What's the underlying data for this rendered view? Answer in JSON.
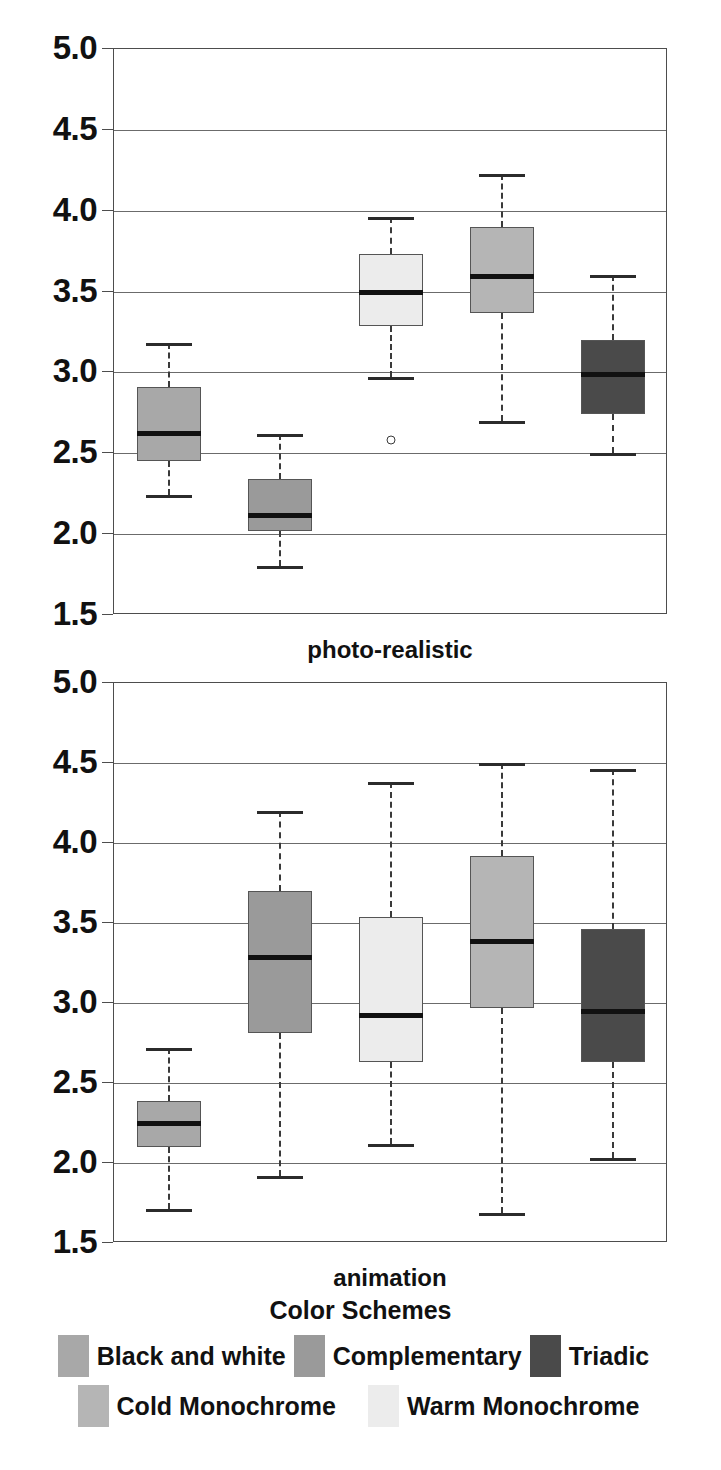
{
  "figure": {
    "title_clipped": "",
    "legend_title": "Color Schemes"
  },
  "colors": {
    "black_and_white": "#a8a8a8",
    "complementary": "#9a9a9a",
    "triadic": "#4a4a4a",
    "cold_monochrome": "#b5b5b5",
    "warm_monochrome": "#ececec",
    "axis": "#4d4d4d",
    "gridline": "#6b6b6b",
    "median": "#111111"
  },
  "axis": {
    "ticks": [
      "5.0",
      "4.5",
      "4.0",
      "3.5",
      "3.0",
      "2.5",
      "2.0",
      "1.5"
    ],
    "min": 1.5,
    "max": 5.0,
    "step": 0.5
  },
  "panels": [
    {
      "id": "photo",
      "xlabel": "photo-realistic"
    },
    {
      "id": "anim",
      "xlabel": "animation"
    }
  ],
  "legend": {
    "rows": [
      [
        {
          "label": "Black and white",
          "color_key": "black_and_white"
        },
        {
          "label": "Complementary",
          "color_key": "complementary"
        },
        {
          "label": "Triadic",
          "color_key": "triadic"
        }
      ],
      [
        {
          "label": "Cold Monochrome",
          "color_key": "cold_monochrome"
        },
        {
          "label": "Warm Monochrome",
          "color_key": "warm_monochrome"
        }
      ]
    ]
  },
  "chart_data": {
    "type": "box",
    "title": "",
    "ylabel": "",
    "xlabel": "",
    "ylim": [
      1.5,
      5.0
    ],
    "ytick_labels": [
      "1.5",
      "2.0",
      "2.5",
      "3.0",
      "3.5",
      "4.0",
      "4.5",
      "5.0"
    ],
    "grid": true,
    "legend_position": "bottom",
    "legend_title": "Color Schemes",
    "groups": [
      "photo-realistic",
      "animation"
    ],
    "categories": [
      "Black and white",
      "Complementary",
      "Warm Monochrome",
      "Cold Monochrome",
      "Triadic"
    ],
    "panels": [
      {
        "name": "photo-realistic",
        "boxes": [
          {
            "category": "Black and white",
            "color_key": "black_and_white",
            "whisker_low": 2.24,
            "q1": 2.45,
            "median": 2.64,
            "q3": 2.91,
            "whisker_high": 3.18,
            "outliers": []
          },
          {
            "category": "Complementary",
            "color_key": "complementary",
            "whisker_low": 1.8,
            "q1": 2.02,
            "median": 2.13,
            "q3": 2.34,
            "whisker_high": 2.62,
            "outliers": []
          },
          {
            "category": "Warm Monochrome",
            "color_key": "warm_monochrome",
            "whisker_low": 2.97,
            "q1": 3.29,
            "median": 3.51,
            "q3": 3.73,
            "whisker_high": 3.96,
            "outliers": [
              2.58
            ]
          },
          {
            "category": "Cold Monochrome",
            "color_key": "cold_monochrome",
            "whisker_low": 2.7,
            "q1": 3.37,
            "median": 3.61,
            "q3": 3.9,
            "whisker_high": 4.23,
            "outliers": []
          },
          {
            "category": "Triadic",
            "color_key": "triadic",
            "whisker_low": 2.5,
            "q1": 2.74,
            "median": 3.0,
            "q3": 3.2,
            "whisker_high": 3.6,
            "outliers": []
          }
        ]
      },
      {
        "name": "animation",
        "boxes": [
          {
            "category": "Black and white",
            "color_key": "black_and_white",
            "whisker_low": 1.71,
            "q1": 2.1,
            "median": 2.26,
            "q3": 2.39,
            "whisker_high": 2.72,
            "outliers": []
          },
          {
            "category": "Complementary",
            "color_key": "complementary",
            "whisker_low": 1.92,
            "q1": 2.81,
            "median": 3.3,
            "q3": 3.7,
            "whisker_high": 4.2,
            "outliers": []
          },
          {
            "category": "Warm Monochrome",
            "color_key": "warm_monochrome",
            "whisker_low": 2.12,
            "q1": 2.63,
            "median": 2.94,
            "q3": 3.54,
            "whisker_high": 4.38,
            "outliers": []
          },
          {
            "category": "Cold Monochrome",
            "color_key": "cold_monochrome",
            "whisker_low": 1.69,
            "q1": 2.97,
            "median": 3.4,
            "q3": 3.92,
            "whisker_high": 4.5,
            "outliers": []
          },
          {
            "category": "Triadic",
            "color_key": "triadic",
            "whisker_low": 2.03,
            "q1": 2.63,
            "median": 2.96,
            "q3": 3.46,
            "whisker_high": 4.46,
            "outliers": []
          }
        ]
      }
    ]
  }
}
